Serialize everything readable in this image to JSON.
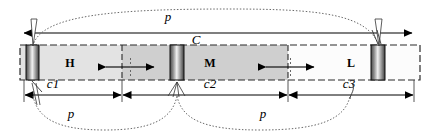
{
  "figure": {
    "title": "",
    "type": "annotated-segment-bar-diagram",
    "background_color": "#ffffff",
    "line_color": "#000000",
    "dotted_color": "#555555"
  },
  "bar": {
    "outline_style": "dashed",
    "segments": [
      {
        "id": "H",
        "label": "H",
        "fill": "#e3e3e3"
      },
      {
        "id": "M",
        "label": "M",
        "fill": "#cfcfcf"
      },
      {
        "id": "L",
        "label": "L",
        "fill": "#fbfbfb"
      }
    ],
    "bands": [
      {
        "id": "band-left",
        "fill": "gradient-gray"
      },
      {
        "id": "band-middle",
        "fill": "gradient-gray"
      },
      {
        "id": "band-right",
        "fill": "gradient-gray"
      }
    ]
  },
  "dimensions": {
    "overall": {
      "id": "C",
      "label": "C",
      "position": "top"
    },
    "lower": [
      {
        "id": "c1",
        "label": "c1"
      },
      {
        "id": "c2",
        "label": "c2"
      },
      {
        "id": "c3",
        "label": "c3"
      }
    ]
  },
  "pointers": {
    "top": {
      "id": "p-top",
      "label": "p"
    },
    "bottom_left": {
      "id": "p-bottom-left",
      "label": "p"
    },
    "bottom_right": {
      "id": "p-bottom-right",
      "label": "p"
    }
  },
  "inner_markers": [
    {
      "id": "marker-left",
      "label": ""
    },
    {
      "id": "marker-right",
      "label": ""
    }
  ]
}
